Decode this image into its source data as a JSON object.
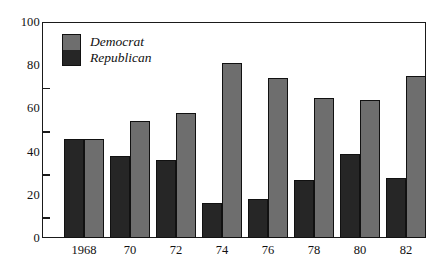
{
  "chart_data": {
    "type": "bar",
    "title": "",
    "subtitle": "",
    "xlabel": "",
    "ylabel": "",
    "categories": [
      "1968",
      "70",
      "72",
      "74",
      "76",
      "78",
      "80",
      "82"
    ],
    "series": [
      {
        "name": "Republican",
        "color": "#262626",
        "values": [
          46,
          38,
          36,
          16,
          18,
          27,
          39,
          28
        ]
      },
      {
        "name": "Democrat",
        "color": "#6e6e6e",
        "values": [
          46,
          54,
          58,
          81,
          74,
          65,
          64,
          75
        ]
      }
    ],
    "ylim": [
      0,
      100
    ],
    "yticks": [
      0,
      20,
      40,
      60,
      80,
      100
    ],
    "ytick_labels": [
      "0",
      "20",
      "40",
      "60",
      "80",
      "100"
    ],
    "grid": false,
    "legend_position": "top-left",
    "legend_entries": [
      {
        "label": "Democrat",
        "color": "#6e6e6e"
      },
      {
        "label": "Republican",
        "color": "#262626"
      }
    ],
    "frame_color": "#1a1a1a",
    "background": "#ffffff"
  }
}
